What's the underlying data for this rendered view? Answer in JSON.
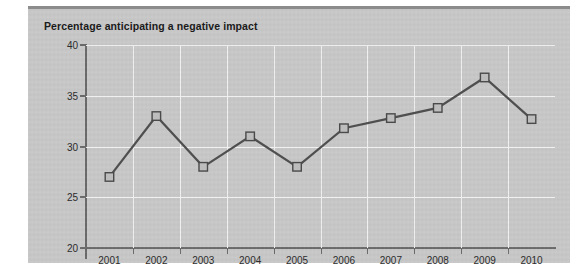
{
  "chart_data": {
    "type": "line",
    "title": "Percentage anticipating a negative impact",
    "xlabel": "",
    "ylabel": "",
    "categories": [
      "2001",
      "2002",
      "2003",
      "2004",
      "2005",
      "2006",
      "2007",
      "2008",
      "2009",
      "2010"
    ],
    "values": [
      27,
      33,
      28,
      31,
      28,
      31.8,
      32.8,
      33.8,
      36.8,
      32.7
    ],
    "series": [
      {
        "name": "Percentage anticipating a negative impact",
        "values": [
          27,
          33,
          28,
          31,
          28,
          31.8,
          32.8,
          33.8,
          36.8,
          32.7
        ]
      }
    ],
    "ylim": [
      20,
      40
    ],
    "yticks": [
      20,
      25,
      30,
      35,
      40
    ],
    "ytick_labels": [
      "20",
      "25",
      "30",
      "35",
      "40"
    ],
    "grid": true,
    "grid_color": "#f2f2f2",
    "legend": "none",
    "line_color": "#4f4f4f",
    "marker": "square",
    "marker_fill": "#bdbdbd",
    "marker_edge": "#4a4a4a",
    "panel_background": "#c9c9c9",
    "axis_color": "#6a6a6a",
    "title_color": "#1b1b1b"
  }
}
